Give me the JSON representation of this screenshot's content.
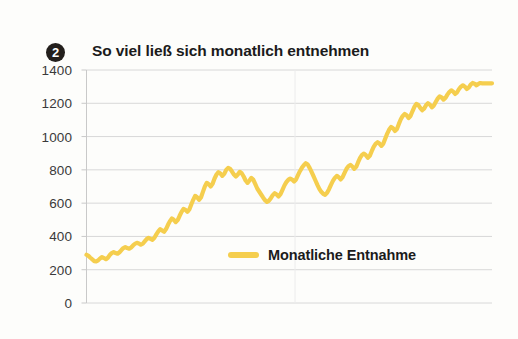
{
  "header": {
    "badge": "2",
    "title": "So viel ließ sich monatlich entnehmen"
  },
  "colors": {
    "series": "#f5ce4e",
    "grid": "#d8d8d8",
    "axis": "#c9c9c9",
    "text": "#3a3a3a",
    "title": "#1b1b1b",
    "badge_bg": "#231f1c",
    "background": "#fdfdfb"
  },
  "chart_data": {
    "type": "line",
    "title": "So viel ließ sich monatlich entnehmen",
    "xlabel": "",
    "ylabel": "",
    "ylim": [
      0,
      1400
    ],
    "yticks": [
      0,
      200,
      400,
      600,
      800,
      1000,
      1200,
      1400
    ],
    "ytick_labels": [
      "0",
      "200",
      "400",
      "600",
      "800",
      "1000",
      "1200",
      "1400"
    ],
    "xticks": [],
    "xtick_labels": [],
    "grid": true,
    "grid_axis": "y",
    "legend": {
      "position": "center",
      "entries": [
        {
          "name": "Monatliche Entnahme",
          "color": "#f5ce4e"
        }
      ]
    },
    "series": [
      {
        "name": "Monatliche Entnahme",
        "color": "#f5ce4e",
        "values": [
          290,
          283,
          272,
          262,
          252,
          250,
          256,
          268,
          276,
          270,
          263,
          272,
          288,
          300,
          306,
          300,
          296,
          305,
          318,
          330,
          336,
          330,
          326,
          334,
          346,
          356,
          362,
          358,
          350,
          356,
          370,
          384,
          392,
          386,
          380,
          392,
          412,
          430,
          444,
          436,
          428,
          444,
          470,
          492,
          508,
          500,
          486,
          498,
          524,
          548,
          566,
          560,
          548,
          562,
          592,
          620,
          644,
          636,
          620,
          634,
          668,
          700,
          722,
          714,
          700,
          716,
          748,
          772,
          786,
          778,
          764,
          776,
          800,
          812,
          806,
          790,
          772,
          760,
          772,
          788,
          780,
          760,
          736,
          722,
          736,
          752,
          740,
          714,
          688,
          670,
          652,
          634,
          618,
          608,
          614,
          630,
          648,
          660,
          652,
          640,
          654,
          680,
          706,
          726,
          740,
          748,
          742,
          730,
          742,
          768,
          792,
          812,
          828,
          840,
          832,
          812,
          788,
          762,
          736,
          710,
          686,
          668,
          656,
          650,
          662,
          684,
          710,
          734,
          752,
          764,
          756,
          742,
          756,
          782,
          806,
          822,
          830,
          820,
          806,
          818,
          846,
          872,
          890,
          898,
          888,
          872,
          884,
          912,
          938,
          956,
          966,
          958,
          944,
          958,
          988,
          1018,
          1042,
          1058,
          1050,
          1034,
          1046,
          1076,
          1104,
          1124,
          1136,
          1128,
          1112,
          1124,
          1152,
          1178,
          1196,
          1190,
          1172,
          1158,
          1168,
          1188,
          1200,
          1192,
          1176,
          1186,
          1208,
          1228,
          1242,
          1236,
          1222,
          1232,
          1252,
          1268,
          1278,
          1270,
          1256,
          1266,
          1286,
          1300,
          1308,
          1300,
          1286,
          1294,
          1312,
          1322,
          1318,
          1308,
          1316,
          1322,
          1320,
          1320,
          1320,
          1320,
          1320,
          1320
        ]
      }
    ]
  }
}
